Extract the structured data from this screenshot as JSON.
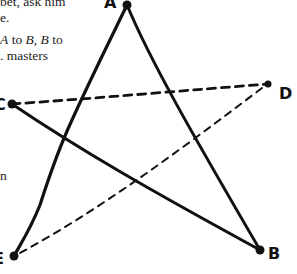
{
  "text": {
    "lines": [
      "bet, ask him",
      "e.",
      "A to B, B to",
      ". masters"
    ],
    "fragment_left": "n"
  },
  "diagram": {
    "points": {
      "A": {
        "label": "A",
        "x": 127,
        "y": 5
      },
      "B": {
        "label": "B",
        "x": 260,
        "y": 250
      },
      "C": {
        "label": "C",
        "x": 12,
        "y": 104
      },
      "D": {
        "label": "D",
        "x": 268,
        "y": 84
      },
      "E": {
        "label": "E",
        "x": 14,
        "y": 256
      }
    },
    "solid_edges": [
      [
        "A",
        "E"
      ],
      [
        "A",
        "B"
      ],
      [
        "C",
        "B"
      ]
    ],
    "dashed_edges": [
      [
        "C",
        "D"
      ],
      [
        "D",
        "E"
      ]
    ],
    "stroke_color": "#111111"
  }
}
